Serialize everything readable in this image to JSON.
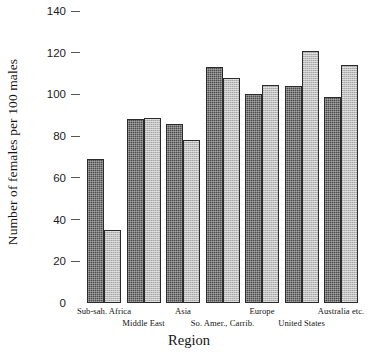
{
  "chart_data": {
    "type": "bar",
    "title": "",
    "xlabel": "Region",
    "ylabel": "Number of females per 100 males",
    "categories": [
      "Sub-sah. Africa",
      "Middle East",
      "Asia",
      "So. Amer., Carrib.",
      "Europe",
      "United States",
      "Australia etc."
    ],
    "series": [
      {
        "name": "dark",
        "values": [
          69,
          88,
          86,
          113,
          100,
          104,
          99
        ]
      },
      {
        "name": "light",
        "values": [
          35,
          88.5,
          78,
          108,
          104.5,
          121,
          114
        ]
      }
    ],
    "yticks": [
      {
        "value": 140,
        "label": "140",
        "dash": true
      },
      {
        "value": 120,
        "label": "120",
        "dash": true
      },
      {
        "value": 100,
        "label": "100",
        "dash": true
      },
      {
        "value": 80,
        "label": "80",
        "dash": true
      },
      {
        "value": 60,
        "label": "60",
        "dash": true
      },
      {
        "value": 40,
        "label": "40",
        "dash": true
      },
      {
        "value": 20,
        "label": "20",
        "dash": true
      },
      {
        "value": 0,
        "label": "0",
        "dash": false
      }
    ],
    "ylim": [
      0,
      145
    ],
    "grid": false,
    "legend": "none",
    "colors": {
      "dark_bar": "#4c4c4c",
      "light_bar": "#bdbdbd",
      "bar_outline": "#2b2b2b",
      "text": "#141414",
      "background": "#ffffff"
    }
  }
}
